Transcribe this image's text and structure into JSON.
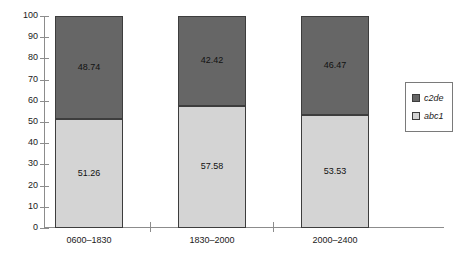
{
  "chart_data": {
    "type": "bar",
    "title": "",
    "subtitle": "",
    "xlabel": "",
    "ylabel": "",
    "stacked": true,
    "stack_total": 100,
    "orientation": "vertical",
    "grid": false,
    "legend_position": "right",
    "ylim": [
      0,
      100
    ],
    "ytick_labels": [
      "100",
      "90",
      "80",
      "70",
      "60",
      "50",
      "40",
      "30",
      "20",
      "10",
      "0"
    ],
    "ytick_values": [
      100,
      90,
      80,
      70,
      60,
      50,
      40,
      30,
      20,
      10,
      0
    ],
    "categories": [
      "0600–1830",
      "1830–2000",
      "2000–2400"
    ],
    "series": [
      {
        "name": "c2de",
        "color": "#666666",
        "values": [
          48.74,
          42.42,
          46.47
        ],
        "labels": [
          "48.74",
          "42.42",
          "46.47"
        ]
      },
      {
        "name": "abc1",
        "color": "#d4d4d4",
        "values": [
          51.26,
          57.58,
          53.53
        ],
        "labels": [
          "51.26",
          "57.58",
          "53.53"
        ]
      }
    ]
  },
  "legend": {
    "entries": [
      {
        "label": "c2de",
        "color": "#666666"
      },
      {
        "label": "abc1",
        "color": "#d4d4d4"
      }
    ]
  },
  "colors": {
    "series_top": "#666666",
    "series_bottom": "#d4d4d4",
    "axis": "#8c8c8c",
    "bar_border": "#3d3d3d",
    "text": "#1a1a1a",
    "background": "#ffffff"
  }
}
